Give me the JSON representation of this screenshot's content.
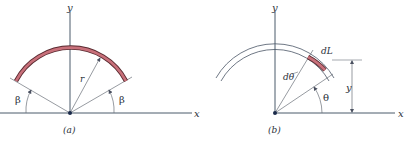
{
  "panel_a": {
    "caption": "(a)",
    "x_label": "x",
    "y_label": "y",
    "radius_label": "r",
    "angle_left_label": "β",
    "angle_right_label": "β"
  },
  "panel_b": {
    "caption": "(b)",
    "x_label": "x",
    "y_label": "y",
    "element_label": "dL",
    "dtheta_label": "dθ",
    "theta_label": "θ",
    "height_label": "y"
  },
  "colors": {
    "arc_fill": "#c8707a",
    "arc_outline": "#5a2a30",
    "axis": "#4a5a6a",
    "line": "#5a6570"
  }
}
